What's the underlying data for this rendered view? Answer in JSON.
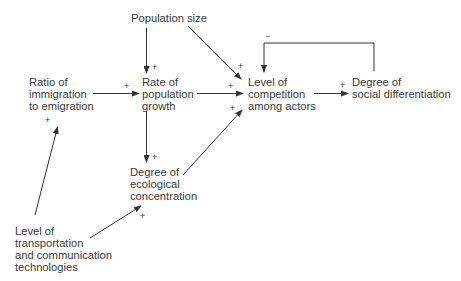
{
  "diagram": {
    "type": "causal-flow",
    "nodes": {
      "population_size": {
        "lines": [
          "Population size"
        ]
      },
      "ratio": {
        "lines": [
          "Ratio of",
          "immigration",
          "to emigration"
        ]
      },
      "rate": {
        "lines": [
          "Rate of",
          "population",
          "growth"
        ]
      },
      "competition": {
        "lines": [
          "Level of",
          "competition",
          "among actors"
        ]
      },
      "differentiation": {
        "lines": [
          "Degree of",
          "social differentiation"
        ]
      },
      "ecological": {
        "lines": [
          "Degree of",
          "ecological",
          "concentration"
        ]
      },
      "transport": {
        "lines": [
          "Level of",
          "transportation",
          "and communication",
          "technologies"
        ]
      }
    },
    "edges": [
      {
        "from": "Population size",
        "to": "Rate of population growth",
        "sign": "+"
      },
      {
        "from": "Population size",
        "to": "Level of competition among actors",
        "sign": "+"
      },
      {
        "from": "Ratio of immigration to emigration",
        "to": "Rate of population growth",
        "sign": "+"
      },
      {
        "from": "Rate of population growth",
        "to": "Level of competition among actors",
        "sign": "+"
      },
      {
        "from": "Rate of population growth",
        "to": "Degree of ecological concentration",
        "sign": "+"
      },
      {
        "from": "Degree of ecological concentration",
        "to": "Level of competition among actors",
        "sign": "+"
      },
      {
        "from": "Level of competition among actors",
        "to": "Degree of social differentiation",
        "sign": "+"
      },
      {
        "from": "Degree of social differentiation",
        "to": "Level of competition among actors",
        "sign": "−"
      },
      {
        "from": "Level of transportation and communication technologies",
        "to": "Ratio of immigration to emigration",
        "sign": "+"
      },
      {
        "from": "Level of transportation and communication technologies",
        "to": "Degree of ecological concentration",
        "sign": "+"
      }
    ],
    "signs": {
      "plus": "+",
      "minus": "−"
    },
    "line_color": "#333333"
  }
}
